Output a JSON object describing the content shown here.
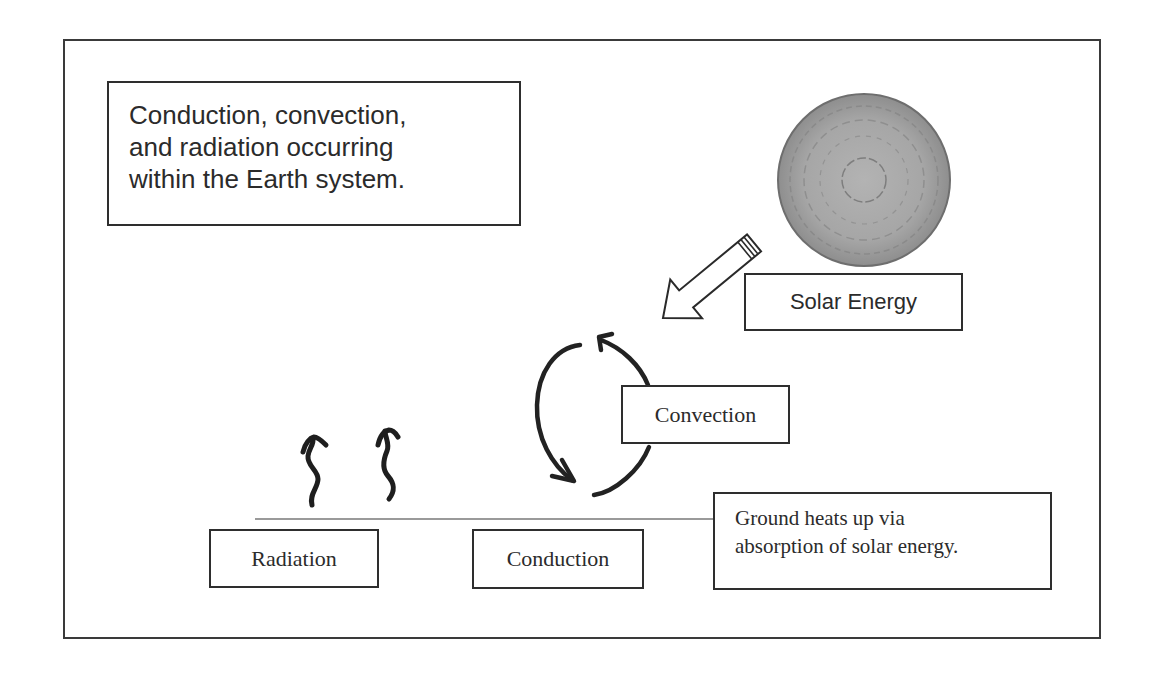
{
  "diagram": {
    "title_lines": [
      "Conduction, convection,",
      "and radiation occurring",
      "within the Earth system."
    ],
    "labels": {
      "solar_energy": "Solar Energy",
      "convection": "Convection",
      "radiation": "Radiation",
      "conduction": "Conduction"
    },
    "ground_note_lines": [
      "Ground heats up via",
      "absorption of solar energy."
    ],
    "icons": {
      "sun": "sun-icon",
      "solar_arrow": "arrow-down-left-icon",
      "convection_cycle": "circular-arrows-icon",
      "radiation_waves": "wavy-up-arrow-icon"
    },
    "colors": {
      "frame": "#3a3a3a",
      "text": "#2b2b2b",
      "sun_fill": "#a8a8a8",
      "ground_line": "#9a9a9a",
      "stroke": "#222222"
    }
  }
}
